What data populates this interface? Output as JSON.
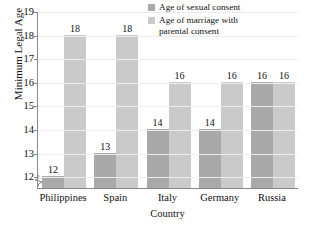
{
  "chart_data": {
    "type": "bar",
    "title": "",
    "xlabel": "Country",
    "ylabel": "Minimum Legal Age",
    "categories": [
      "Philippines",
      "Spain",
      "Italy",
      "Germany",
      "Russia"
    ],
    "series": [
      {
        "name": "Age of sexual consent",
        "color": "#a9a9a9",
        "values": [
          12,
          13,
          14,
          14,
          16
        ]
      },
      {
        "name": "Age of marriage with parental consent",
        "color": "#cacaca",
        "values": [
          18,
          18,
          16,
          16,
          16
        ]
      }
    ],
    "ylim": [
      11.5,
      19
    ],
    "yticks": [
      12,
      13,
      14,
      15,
      16,
      17,
      18,
      19
    ],
    "ytick_labels": [
      "12",
      "13",
      "14",
      "15",
      "16",
      "17",
      "18",
      "19"
    ],
    "grid": true,
    "axis_break": true,
    "legend_position": "top-right",
    "legend": [
      {
        "label_line1": "Age of sexual consent",
        "label_line2": ""
      },
      {
        "label_line1": "Age of marriage with",
        "label_line2": "parental consent"
      }
    ]
  }
}
